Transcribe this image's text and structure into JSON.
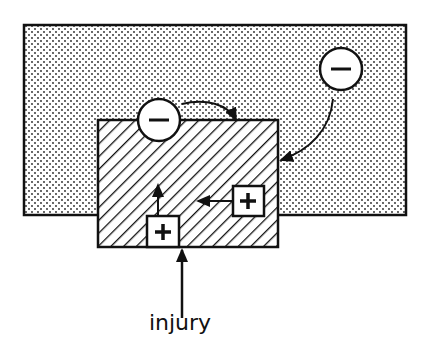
{
  "diagram": {
    "labels": {
      "injury": "injury"
    },
    "nodes": [
      {
        "id": "outer-region",
        "kind": "dotted-area"
      },
      {
        "id": "injured-region",
        "kind": "hatched-area"
      },
      {
        "id": "inhibitor-local",
        "symbol": "−",
        "shape": "circle"
      },
      {
        "id": "inhibitor-distant",
        "symbol": "−",
        "shape": "circle"
      },
      {
        "id": "activator-origin",
        "symbol": "+",
        "shape": "square"
      },
      {
        "id": "activator-spread",
        "symbol": "+",
        "shape": "square"
      }
    ],
    "edges": [
      {
        "from": "injury",
        "to": "injured-region"
      },
      {
        "from": "activator-origin",
        "to": "injured-region"
      },
      {
        "from": "activator-spread",
        "to": "injured-region"
      },
      {
        "from": "inhibitor-local",
        "to": "injured-region"
      },
      {
        "from": "inhibitor-distant",
        "to": "injured-region"
      }
    ],
    "symbols": {
      "minus": "−",
      "plus": "+"
    }
  }
}
